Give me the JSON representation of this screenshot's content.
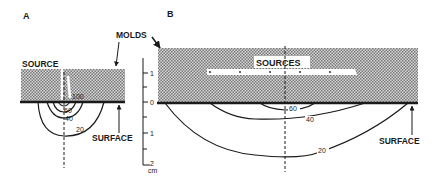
{
  "panels": {
    "a": {
      "label": "A",
      "source_label": "SOURCE",
      "surface_label": "SURFACE",
      "contours": [
        "100",
        "60",
        "40",
        "20"
      ]
    },
    "b": {
      "label": "B",
      "sources_label": "SOURCES",
      "surface_label": "SURFACE",
      "contours": [
        "60",
        "40",
        "20"
      ]
    }
  },
  "shared": {
    "molds_label": "MOLDS"
  },
  "scale_bar": {
    "ticks": [
      "1",
      "0",
      "1",
      "2"
    ],
    "unit": "cm"
  },
  "colors": {
    "ink": "#1a1a1a",
    "hatch": "#9a9a9a",
    "background": "#ffffff"
  }
}
